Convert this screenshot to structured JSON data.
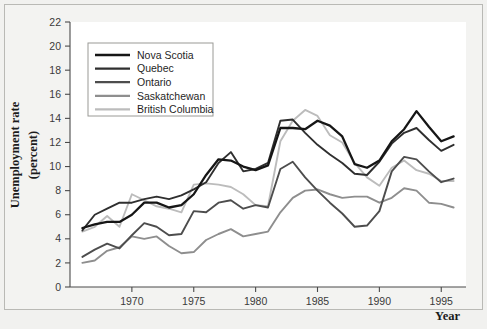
{
  "figure": {
    "background_color": "#f1f1ef",
    "plot_background_color": "#ffffff",
    "frame_color": "#b9b9b5"
  },
  "axis": {
    "y_title_line1": "Unemployment rate",
    "y_title_line2": "(percent)",
    "x_title": "Year"
  },
  "legend": {
    "position": "top-left-inside",
    "items": [
      {
        "label": "Nova Scotia",
        "color": "#161616"
      },
      {
        "label": "Quebec",
        "color": "#2f2f2f"
      },
      {
        "label": "Ontario",
        "color": "#4d4d4d"
      },
      {
        "label": "Saskatchewan",
        "color": "#8e8e8e"
      },
      {
        "label": "British Columbia",
        "color": "#bcbcbc"
      }
    ]
  },
  "chart_data": {
    "type": "line",
    "title": "",
    "xlabel": "Year",
    "ylabel": "Unemployment rate (percent)",
    "xlim": [
      1965,
      1997
    ],
    "ylim": [
      0,
      22
    ],
    "ytick_step": 2,
    "yticks": [
      0,
      2,
      4,
      6,
      8,
      10,
      12,
      14,
      16,
      18,
      20,
      22
    ],
    "xticks": [
      1970,
      1975,
      1980,
      1985,
      1990,
      1995
    ],
    "xtick_labels": [
      "1970",
      "1975",
      "1980",
      "1985",
      "1990",
      "1995"
    ],
    "grid": false,
    "legend_position": "upper left",
    "x": [
      1966,
      1967,
      1968,
      1969,
      1970,
      1971,
      1972,
      1973,
      1974,
      1975,
      1976,
      1977,
      1978,
      1979,
      1980,
      1981,
      1982,
      1983,
      1984,
      1985,
      1986,
      1987,
      1988,
      1989,
      1990,
      1991,
      1992,
      1993,
      1994,
      1995,
      1996
    ],
    "series": [
      {
        "name": "Nova Scotia",
        "color": "#161616",
        "values": [
          4.9,
          5.2,
          5.4,
          5.4,
          6.0,
          7.0,
          7.0,
          6.6,
          6.8,
          7.7,
          9.3,
          10.6,
          10.5,
          10.0,
          9.7,
          10.1,
          13.2,
          13.2,
          13.1,
          13.8,
          13.4,
          12.5,
          10.2,
          9.9,
          10.5,
          12.1,
          13.1,
          14.6,
          13.3,
          12.1,
          12.5
        ]
      },
      {
        "name": "Quebec",
        "color": "#2f2f2f",
        "values": [
          4.7,
          6.0,
          6.5,
          7.0,
          7.0,
          7.3,
          7.5,
          7.3,
          7.6,
          8.1,
          8.7,
          10.3,
          11.2,
          9.6,
          9.8,
          10.3,
          13.8,
          13.9,
          12.8,
          11.8,
          11.0,
          10.3,
          9.4,
          9.3,
          10.4,
          11.9,
          12.8,
          13.2,
          12.2,
          11.3,
          11.8
        ]
      },
      {
        "name": "Ontario",
        "color": "#4d4d4d",
        "values": [
          2.5,
          3.1,
          3.6,
          3.2,
          4.3,
          5.3,
          5.0,
          4.3,
          4.4,
          6.3,
          6.2,
          7.0,
          7.2,
          6.5,
          6.8,
          6.6,
          9.8,
          10.4,
          9.1,
          8.0,
          7.0,
          6.1,
          5.0,
          5.1,
          6.3,
          9.6,
          10.8,
          10.6,
          9.6,
          8.7,
          9.0
        ]
      },
      {
        "name": "Saskatchewan",
        "color": "#8e8e8e",
        "values": [
          2.0,
          2.2,
          3.0,
          3.3,
          4.2,
          4.0,
          4.2,
          3.4,
          2.8,
          2.9,
          3.9,
          4.4,
          4.8,
          4.2,
          4.4,
          4.6,
          6.2,
          7.4,
          8.0,
          8.1,
          7.7,
          7.4,
          7.5,
          7.5,
          7.0,
          7.4,
          8.2,
          8.0,
          7.0,
          6.9,
          6.6
        ]
      },
      {
        "name": "British Columbia",
        "color": "#bcbcbc",
        "values": [
          4.6,
          5.0,
          5.9,
          5.0,
          7.7,
          7.2,
          6.7,
          6.5,
          6.2,
          8.5,
          8.6,
          8.5,
          8.3,
          7.7,
          6.8,
          6.7,
          12.1,
          13.8,
          14.7,
          14.2,
          12.6,
          12.0,
          10.3,
          9.1,
          8.4,
          9.9,
          10.5,
          9.7,
          9.4,
          8.8,
          8.8
        ]
      }
    ]
  }
}
